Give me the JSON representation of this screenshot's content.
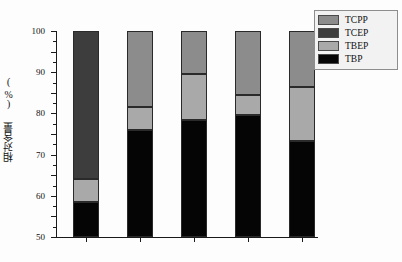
{
  "chart_data": {
    "type": "bar",
    "stacked": true,
    "title": "",
    "xlabel": "",
    "ylabel": "相对含量 (%)",
    "ylim": [
      0,
      100
    ],
    "ytick_labels": [
      "0",
      "10",
      "20",
      "30",
      "40",
      "50",
      "60",
      "70",
      "80",
      "90",
      "100"
    ],
    "ytick_values": [
      0,
      10,
      20,
      30,
      40,
      50,
      60,
      70,
      80,
      90,
      100
    ],
    "grid": false,
    "legend_position": "top-right",
    "categories": [
      "1",
      "2",
      "3",
      "4",
      "5"
    ],
    "category_labels_visible": false,
    "series": [
      {
        "name": "TBP",
        "color": "#050505",
        "values": [
          17.0,
          52.0,
          57.0,
          59.0,
          46.5
        ]
      },
      {
        "name": "TBEP",
        "color": "#a9a9a9",
        "values": [
          11.0,
          11.0,
          22.0,
          10.0,
          26.5
        ]
      },
      {
        "name": "TCEP",
        "color": "#3d3d3d",
        "values": [
          72.0,
          0.0,
          0.0,
          0.0,
          0.0
        ]
      },
      {
        "name": "TCPP",
        "color": "#8c8c8c",
        "values": [
          0.0,
          37.0,
          21.0,
          31.0,
          27.0
        ]
      }
    ],
    "stack_order": [
      "TBP",
      "TBEP",
      "TCEP",
      "TCPP"
    ]
  },
  "legend": {
    "items": [
      {
        "label": "TCPP",
        "color": "#8c8c8c"
      },
      {
        "label": "TCEP",
        "color": "#3d3d3d"
      },
      {
        "label": "TBEP",
        "color": "#a9a9a9"
      },
      {
        "label": "TBP",
        "color": "#050505"
      }
    ]
  },
  "axis": {
    "y_title": "相对含量 (%)"
  }
}
